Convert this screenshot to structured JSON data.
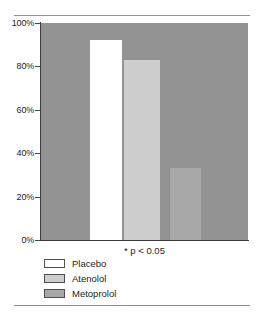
{
  "chart_data": {
    "type": "bar",
    "title": "",
    "subtitle": "",
    "xlabel": "",
    "ylabel": "",
    "categories": [
      "Placebo",
      "Atenolol",
      "Metoprolol"
    ],
    "values": [
      92,
      83,
      33
    ],
    "value_suffix": "%",
    "ylim": [
      0,
      100
    ],
    "ytick_values": [
      0,
      20,
      40,
      60,
      80,
      100
    ],
    "ytick_labels": [
      "0%",
      "20%",
      "40%",
      "60%",
      "80%",
      "100%"
    ],
    "grid": false,
    "legend_position": "bottom-left",
    "plot_background": "#939393",
    "series": [
      {
        "name": "Placebo",
        "value": 92,
        "color": "#ffffff"
      },
      {
        "name": "Atenolol",
        "value": 83,
        "color": "#cdcdcd"
      },
      {
        "name": "Metoprolol",
        "value": 33,
        "color": "#a8a8a8"
      }
    ],
    "annotations": [
      "* p < 0.05"
    ]
  },
  "axis": {
    "ticks": [
      {
        "label": "100%",
        "value": 100
      },
      {
        "label": "80%",
        "value": 80
      },
      {
        "label": "60%",
        "value": 60
      },
      {
        "label": "40%",
        "value": 40
      },
      {
        "label": "20%",
        "value": 20
      },
      {
        "label": "0%",
        "value": 0
      }
    ]
  },
  "legend": {
    "items": [
      {
        "label": "Placebo",
        "color": "#ffffff"
      },
      {
        "label": "Atenolol",
        "color": "#cdcdcd"
      },
      {
        "label": "Metoprolol",
        "color": "#a8a8a8"
      }
    ]
  },
  "footnote": {
    "text": "* p < 0.05"
  }
}
